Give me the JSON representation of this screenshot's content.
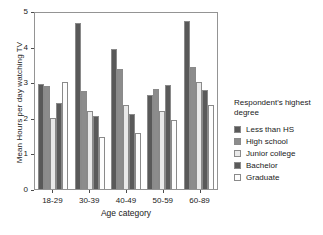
{
  "chart_data": {
    "type": "bar",
    "title": "",
    "xlabel": "Age category",
    "ylabel": "Mean Hours per day watching TV",
    "categories": [
      "18-29",
      "30-39",
      "40-49",
      "50-59",
      "60-89"
    ],
    "ylim": [
      0,
      5
    ],
    "yticks": [
      "0",
      "1",
      "2",
      "3",
      "4",
      "5"
    ],
    "grid": false,
    "legend_position": "right",
    "legend_title": "Respondent's highest degree",
    "series": [
      {
        "name": "Less than HS",
        "color": "#595959",
        "values": [
          2.95,
          4.65,
          3.93,
          2.63,
          4.72
        ]
      },
      {
        "name": "High school",
        "color": "#8c8c8c",
        "values": [
          2.89,
          2.75,
          3.36,
          2.81,
          3.42
        ]
      },
      {
        "name": "Junior college",
        "color": "#e9e9e9",
        "values": [
          2.0,
          2.18,
          2.37,
          2.18,
          3.0
        ]
      },
      {
        "name": "Bachelor",
        "color": "#5a5a5a",
        "values": [
          2.43,
          2.05,
          2.12,
          2.92,
          2.78
        ]
      },
      {
        "name": "Graduate",
        "color": "#fdfdfd",
        "values": [
          3.0,
          1.45,
          1.56,
          1.94,
          2.37
        ]
      }
    ]
  },
  "legend": {
    "title": "Respondent's highest degree"
  }
}
